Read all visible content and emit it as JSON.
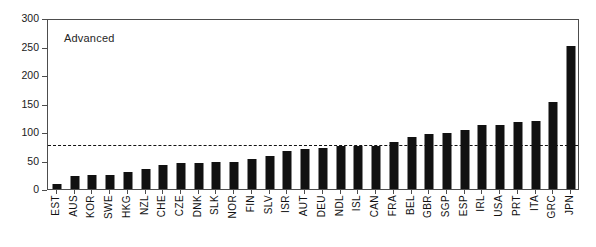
{
  "chart_data": {
    "type": "bar",
    "title": "",
    "panel_label": "Advanced",
    "xlabel": "",
    "ylabel": "",
    "ylim": [
      0,
      300
    ],
    "yticks": [
      0,
      50,
      100,
      150,
      200,
      250,
      300
    ],
    "ytick_labels": [
      "0",
      "50",
      "100",
      "150",
      "200",
      "250",
      "300"
    ],
    "grid": false,
    "legend": null,
    "bar_color": "#111111",
    "reference_line": {
      "value": 80,
      "style": "dashed",
      "color": "#111111"
    },
    "categories": [
      "EST",
      "AUS",
      "KOR",
      "SWE",
      "HKG",
      "NZL",
      "CHE",
      "CZE",
      "DNK",
      "SLK",
      "NOR",
      "FIN",
      "SLV",
      "ISR",
      "AUT",
      "DEU",
      "NDL",
      "ISL",
      "CAN",
      "FRA",
      "BEL",
      "GBR",
      "SGP",
      "ESP",
      "IRL",
      "USA",
      "PRT",
      "ITA",
      "GRC",
      "JPN"
    ],
    "values": [
      8,
      22,
      24,
      24,
      29,
      35,
      42,
      45,
      45,
      48,
      48,
      52,
      58,
      67,
      70,
      72,
      75,
      75,
      76,
      83,
      92,
      97,
      98,
      103,
      112,
      113,
      118,
      120,
      152,
      251
    ]
  }
}
